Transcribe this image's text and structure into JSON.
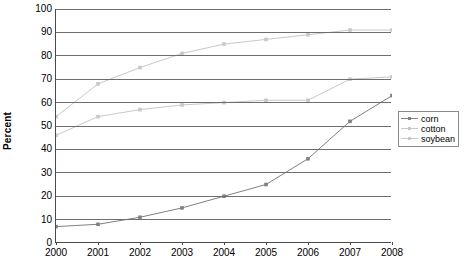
{
  "chart_data": {
    "type": "line",
    "title": "",
    "xlabel": "",
    "ylabel": "Percent",
    "x": [
      2000,
      2001,
      2002,
      2003,
      2004,
      2005,
      2006,
      2007,
      2008
    ],
    "categories": [
      "2000",
      "2001",
      "2002",
      "2003",
      "2004",
      "2005",
      "2006",
      "2007",
      "2008"
    ],
    "xlim": [
      2000,
      2008
    ],
    "ylim": [
      0,
      100
    ],
    "yticks": [
      0,
      10,
      20,
      30,
      40,
      50,
      60,
      70,
      80,
      90,
      100
    ],
    "ytick_labels": [
      "0",
      "10",
      "20",
      "30",
      "40",
      "50",
      "60",
      "70",
      "80",
      "90",
      "100"
    ],
    "grid": "horizontal",
    "legend_position": "right",
    "series": [
      {
        "name": "corn",
        "color": "#808080",
        "marker": "square",
        "values": [
          7,
          8,
          11,
          15,
          20,
          25,
          36,
          52,
          63
        ]
      },
      {
        "name": "cotton",
        "color": "#c8c8c8",
        "marker": "square",
        "values": [
          46,
          54,
          57,
          59,
          60,
          61,
          61,
          70,
          71
        ]
      },
      {
        "name": "soybean",
        "color": "#c8c8c8",
        "marker": "square",
        "values": [
          54,
          68,
          75,
          81,
          85,
          87,
          89,
          91,
          91
        ]
      }
    ]
  },
  "legend": {
    "items": [
      {
        "label": "corn"
      },
      {
        "label": "cotton"
      },
      {
        "label": "soybean"
      }
    ]
  },
  "axis": {
    "y_title": "Percent"
  }
}
